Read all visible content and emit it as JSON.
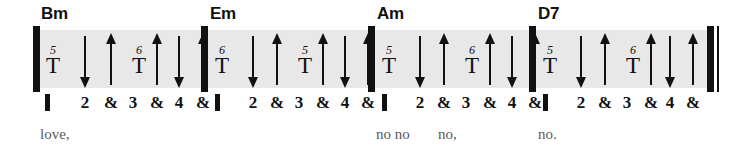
{
  "staff": {
    "band_color": "#e8e8e8",
    "ink_color": "#111111",
    "lyric_color": "#5a5a5a"
  },
  "measures": [
    {
      "chord": "Bm",
      "chord_x": 41,
      "barline_x": 33,
      "beats": [
        {
          "label": "",
          "type": "downbeat-marker",
          "x": 47
        },
        {
          "label": "2",
          "type": "number",
          "x": 85
        },
        {
          "label": "&",
          "type": "and",
          "x": 111
        },
        {
          "label": "3",
          "type": "number",
          "x": 133
        },
        {
          "label": "&",
          "type": "and",
          "x": 157
        },
        {
          "label": "4",
          "type": "number",
          "x": 179
        },
        {
          "label": "&",
          "type": "and",
          "x": 203
        }
      ],
      "strokes": [
        {
          "kind": "thumb",
          "finger": "5",
          "x": 44
        },
        {
          "kind": "down",
          "x": 85
        },
        {
          "kind": "up",
          "x": 111
        },
        {
          "kind": "thumb",
          "finger": "6",
          "x": 130
        },
        {
          "kind": "up",
          "x": 157
        },
        {
          "kind": "down",
          "x": 179
        },
        {
          "kind": "up",
          "x": 203
        }
      ],
      "lyric": "love,",
      "lyric_x": 40
    },
    {
      "chord": "Em",
      "chord_x": 210,
      "barline_x": 201,
      "beats": [
        {
          "label": "",
          "type": "downbeat-marker",
          "x": 217
        },
        {
          "label": "2",
          "type": "number",
          "x": 253
        },
        {
          "label": "&",
          "type": "and",
          "x": 277
        },
        {
          "label": "3",
          "type": "number",
          "x": 299
        },
        {
          "label": "&",
          "type": "and",
          "x": 323
        },
        {
          "label": "4",
          "type": "number",
          "x": 345
        },
        {
          "label": "&",
          "type": "and",
          "x": 368
        }
      ],
      "strokes": [
        {
          "kind": "thumb",
          "finger": "6",
          "x": 213
        },
        {
          "kind": "down",
          "x": 253
        },
        {
          "kind": "up",
          "x": 277
        },
        {
          "kind": "thumb",
          "finger": "5",
          "x": 296
        },
        {
          "kind": "up",
          "x": 323
        },
        {
          "kind": "down",
          "x": 345
        },
        {
          "kind": "up",
          "x": 368
        }
      ],
      "lyric": "",
      "lyric_x": 210
    },
    {
      "chord": "Am",
      "chord_x": 377,
      "barline_x": 368,
      "beats": [
        {
          "label": "",
          "type": "downbeat-marker",
          "x": 384
        },
        {
          "label": "2",
          "type": "number",
          "x": 420
        },
        {
          "label": "&",
          "type": "and",
          "x": 444
        },
        {
          "label": "3",
          "type": "number",
          "x": 466
        },
        {
          "label": "&",
          "type": "and",
          "x": 490
        },
        {
          "label": "4",
          "type": "number",
          "x": 512
        },
        {
          "label": "&",
          "type": "and",
          "x": 535
        }
      ],
      "strokes": [
        {
          "kind": "thumb",
          "finger": "5",
          "x": 380
        },
        {
          "kind": "down",
          "x": 420
        },
        {
          "kind": "up",
          "x": 444
        },
        {
          "kind": "thumb",
          "finger": "6",
          "x": 463
        },
        {
          "kind": "up",
          "x": 490
        },
        {
          "kind": "down",
          "x": 512
        },
        {
          "kind": "up",
          "x": 535
        }
      ],
      "lyric": "no no",
      "lyric_x": 376,
      "lyric2": "no,",
      "lyric2_x": 438
    },
    {
      "chord": "D7",
      "chord_x": 538,
      "barline_x": 529,
      "beats": [
        {
          "label": "",
          "type": "downbeat-marker",
          "x": 545
        },
        {
          "label": "2",
          "type": "number",
          "x": 581
        },
        {
          "label": "&",
          "type": "and",
          "x": 605
        },
        {
          "label": "3",
          "type": "number",
          "x": 627
        },
        {
          "label": "&",
          "type": "and",
          "x": 651
        },
        {
          "label": "4",
          "type": "number",
          "x": 670
        },
        {
          "label": "&",
          "type": "and",
          "x": 693
        }
      ],
      "strokes": [
        {
          "kind": "thumb",
          "finger": "5",
          "x": 541
        },
        {
          "kind": "down",
          "x": 581
        },
        {
          "kind": "up",
          "x": 605
        },
        {
          "kind": "thumb",
          "finger": "6",
          "x": 624
        },
        {
          "kind": "up",
          "x": 651
        },
        {
          "kind": "down",
          "x": 670
        },
        {
          "kind": "up",
          "x": 693
        }
      ],
      "lyric": "no.",
      "lyric_x": 538
    }
  ],
  "end_barline": {
    "thick_x": 707,
    "thin_x": 717
  },
  "band": {
    "left": 33,
    "width": 681
  }
}
